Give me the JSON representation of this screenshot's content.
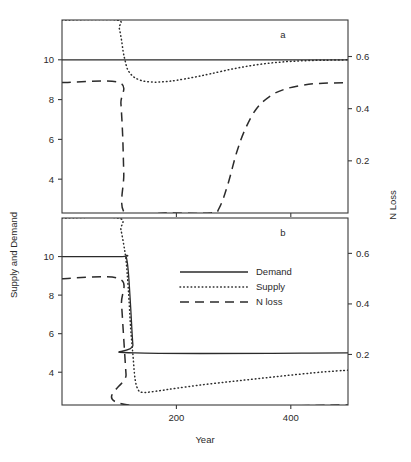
{
  "figure": {
    "xlabel": "Year",
    "ylabel_left": "Supply and Demand",
    "ylabel_right": "N Loss",
    "panel_a_label": "a",
    "panel_b_label": "b"
  },
  "legend": {
    "position": "middle-center of panel b",
    "items": [
      {
        "label": "Demand",
        "style": "solid"
      },
      {
        "label": "Supply",
        "style": "dotted"
      },
      {
        "label": "N loss",
        "style": "dashed"
      }
    ]
  },
  "axes": {
    "x_ticks": [
      "200",
      "400"
    ],
    "x_tick_values": [
      200,
      400
    ],
    "y_left_ticks": [
      "10",
      "8",
      "6",
      "4"
    ],
    "y_left_tick_values": [
      10,
      8,
      6,
      4
    ],
    "y_right_ticks": [
      "0.6",
      "0.4",
      "0.2"
    ],
    "y_right_tick_values": [
      0.6,
      0.4,
      0.2
    ]
  },
  "chart_data": {
    "type": "line",
    "title": "",
    "xlabel": "Year",
    "ylabel": "Supply and Demand",
    "ylabel_right": "N Loss",
    "xlim": [
      0,
      500
    ],
    "ylim_left": [
      2.3,
      12.0
    ],
    "ylim_right": [
      0.0,
      0.74
    ],
    "grid": false,
    "legend_position": "inside-center",
    "panels": [
      {
        "panel": "a",
        "label": "a",
        "series": [
          {
            "name": "Demand",
            "style": "solid",
            "axis": "left",
            "x": [
              0,
              100,
              110,
              500
            ],
            "values": [
              10,
              10,
              10,
              10
            ]
          },
          {
            "name": "Supply",
            "style": "dotted",
            "axis": "left",
            "x": [
              0,
              95,
              100,
              104,
              107,
              110,
              115,
              125,
              140,
              160,
              180,
              200,
              230,
              260,
              300,
              340,
              380,
              420,
              460,
              500
            ],
            "values": [
              12.0,
              12.0,
              11.6,
              11.0,
              10.4,
              10.0,
              9.5,
              9.15,
              8.95,
              8.88,
              8.9,
              8.97,
              9.12,
              9.3,
              9.55,
              9.75,
              9.88,
              9.95,
              9.98,
              10.0
            ]
          },
          {
            "name": "N loss",
            "style": "dashed",
            "axis": "right",
            "x": [
              0,
              100,
              103,
              106,
              108,
              110,
              180,
              260,
              275,
              290,
              305,
              320,
              340,
              365,
              390,
              420,
              450,
              500
            ],
            "values": [
              0.5,
              0.5,
              0.42,
              0.3,
              0.15,
              0.0,
              0.0,
              0.0,
              0.02,
              0.11,
              0.23,
              0.32,
              0.4,
              0.45,
              0.475,
              0.49,
              0.497,
              0.5
            ]
          }
        ]
      },
      {
        "panel": "b",
        "label": "b",
        "series": [
          {
            "name": "Demand",
            "style": "solid",
            "axis": "left",
            "x": [
              0,
              105,
              112,
              116,
              120,
              124,
              128,
              500
            ],
            "values": [
              10,
              10,
              10,
              9.2,
              7.4,
              5.4,
              5.0,
              5.0
            ]
          },
          {
            "name": "Supply",
            "style": "dotted",
            "axis": "left",
            "x": [
              0,
              98,
              103,
              108,
              112,
              116,
              120,
              124,
              128,
              134,
              142,
              155,
              175,
              200,
              240,
              290,
              340,
              390,
              440,
              480,
              500
            ],
            "values": [
              12.0,
              12.0,
              11.4,
              10.6,
              9.8,
              8.3,
              6.3,
              4.9,
              3.6,
              3.05,
              2.95,
              2.98,
              3.06,
              3.17,
              3.33,
              3.5,
              3.66,
              3.82,
              3.97,
              4.07,
              4.1
            ]
          },
          {
            "name": "N loss",
            "style": "dashed",
            "axis": "right",
            "x": [
              0,
              100,
              104,
              108,
              112,
              116,
              500
            ],
            "values": [
              0.5,
              0.5,
              0.4,
              0.26,
              0.12,
              0.0,
              0.0
            ]
          }
        ]
      }
    ]
  }
}
